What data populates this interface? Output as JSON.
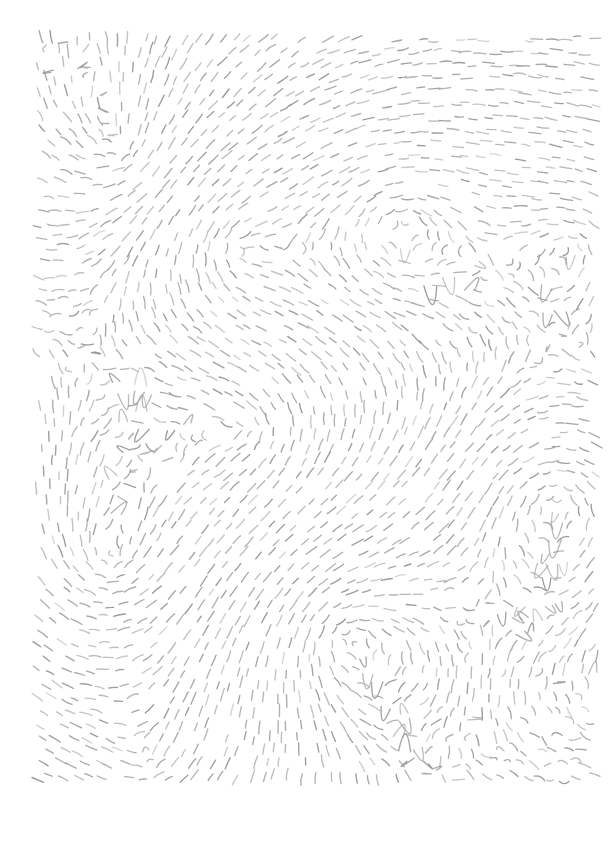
{
  "artwork": {
    "title": "Flow Field Dash Pattern",
    "medium": "generative-line-field",
    "canvas": {
      "width": 613,
      "height": 842,
      "background_color": "#ffffff"
    },
    "margins": {
      "left": 38,
      "top": 38,
      "right": 18,
      "bottom": 59
    },
    "field_box": {
      "x": 38,
      "y": 38,
      "width": 557,
      "height": 745
    }
  },
  "stroke_style": {
    "color": "#9a9a9a",
    "color_light": "#b4b4b4",
    "width": 1.35,
    "linecap": "round",
    "dash_length_min": 7,
    "dash_length_max": 13,
    "dash_length_mean": 10.5,
    "curvature": 0.16
  },
  "grid": {
    "spacing_x": 13.2,
    "spacing_y": 13.2,
    "jitter_amount": 3.4,
    "columns": 43,
    "rows": 57,
    "approximate_dash_count": 2350
  },
  "flow_field": {
    "type": "multi-vortex-superposition",
    "base_angle_deg": 0,
    "noise_scale": 0.0062,
    "noise_strength_deg": 52,
    "singularities": [
      {
        "name": "vortex-upper-left-mid",
        "x": 240,
        "y": 250,
        "strength": 1.0,
        "sign": 1,
        "falloff": 120
      },
      {
        "name": "vortex-upper-center",
        "x": 402,
        "y": 225,
        "strength": 1.05,
        "sign": 1,
        "falloff": 128
      },
      {
        "name": "vortex-upper-right-edge",
        "x": 574,
        "y": 249,
        "strength": 0.85,
        "sign": 1,
        "falloff": 108
      },
      {
        "name": "vortex-lower-right",
        "x": 556,
        "y": 504,
        "strength": 1.0,
        "sign": 1,
        "falloff": 124
      },
      {
        "name": "vortex-lower-center",
        "x": 345,
        "y": 636,
        "strength": 1.05,
        "sign": 1,
        "falloff": 130
      },
      {
        "name": "saddle-left-upper",
        "x": 120,
        "y": 150,
        "strength": 0.55,
        "sign": -1,
        "falloff": 180
      },
      {
        "name": "saddle-left-lower",
        "x": 110,
        "y": 560,
        "strength": 0.6,
        "sign": -1,
        "falloff": 190
      },
      {
        "name": "saddle-center",
        "x": 250,
        "y": 430,
        "strength": 0.5,
        "sign": -1,
        "falloff": 175
      },
      {
        "name": "saddle-bottom-left",
        "x": 150,
        "y": 760,
        "strength": 0.45,
        "sign": -1,
        "falloff": 165
      }
    ]
  },
  "render": {
    "seed": 20240917,
    "opacity_min": 0.55,
    "opacity_max": 1.0,
    "skip_probability": 0.07
  }
}
